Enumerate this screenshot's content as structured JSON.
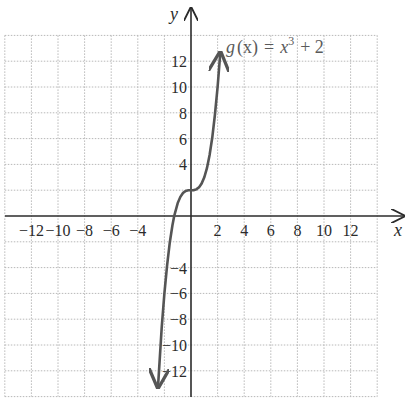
{
  "chart_data": {
    "type": "line",
    "title": "",
    "function_label": "g(x) = x^3 + 2",
    "function_label_parts": {
      "name": "g",
      "arg": "(x)",
      "eq": "=",
      "base": "x",
      "exp": "3",
      "rest": "+ 2"
    },
    "xlabel": "x",
    "ylabel": "y",
    "xlim": [
      -14,
      14
    ],
    "ylim": [
      -14,
      14
    ],
    "grid": true,
    "grid_step": 2,
    "x_ticks": [
      -12,
      -10,
      -8,
      -6,
      -4,
      2,
      4,
      6,
      8,
      10,
      12
    ],
    "x_tick_labels": [
      "−12",
      "−10",
      "−8",
      "−6",
      "−4",
      "2",
      "4",
      "6",
      "8",
      "10",
      "12"
    ],
    "y_ticks": [
      12,
      10,
      8,
      6,
      4,
      -4,
      -6,
      -8,
      -10,
      -12
    ],
    "y_tick_labels": [
      "12",
      "10",
      "8",
      "6",
      "4",
      "−4",
      "−6",
      "−8",
      "−10",
      "−12"
    ],
    "series": [
      {
        "name": "g(x) = x^3 + 2",
        "x": [
          -2.48,
          -2.2,
          -2.0,
          -1.8,
          -1.6,
          -1.4,
          -1.26,
          -1.0,
          -0.8,
          -0.6,
          -0.4,
          -0.2,
          0,
          0.2,
          0.4,
          0.6,
          0.8,
          1.0,
          1.2,
          1.4,
          1.6,
          1.8,
          2.0,
          2.2
        ],
        "values": [
          -13.25,
          -8.65,
          -6.0,
          -3.83,
          -2.1,
          -0.74,
          0.0,
          1.0,
          1.49,
          1.78,
          1.94,
          1.99,
          2.0,
          2.01,
          2.06,
          2.22,
          2.51,
          3.0,
          3.73,
          4.74,
          6.1,
          7.83,
          10.0,
          12.65
        ],
        "color": "#555555",
        "arrows": "both"
      }
    ]
  },
  "colors": {
    "axis": "#2b2b2b",
    "grid": "#b5b5b5",
    "curve": "#555555",
    "text": "#2b2b2b"
  }
}
